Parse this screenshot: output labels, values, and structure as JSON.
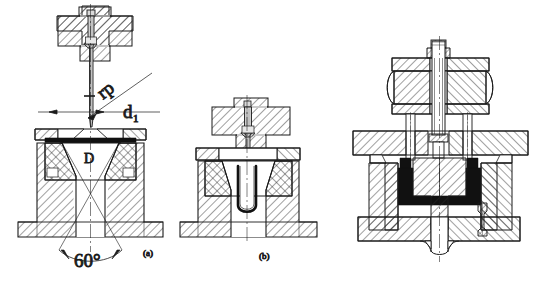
{
  "figure": {
    "background_color": "#ffffff",
    "line_color": "#1a1a1a",
    "hatch_color": "#2b2b2b",
    "fill_black": "#111111"
  },
  "panels": [
    {
      "id": "a",
      "caption": "(a)",
      "description": "Punch and conical die with 60 degree included angle, sheet blank on die face",
      "annotations": [
        {
          "name": "punch-radius",
          "text": "rp",
          "rotated": true
        },
        {
          "name": "punch-diameter",
          "text": "d",
          "subscript": "1"
        },
        {
          "name": "die-diameter",
          "text": "D"
        },
        {
          "name": "cone-angle",
          "text": "60°"
        }
      ]
    },
    {
      "id": "b",
      "caption": "(b)",
      "description": "Punch fully engaged, drawn cup formed inside die cavity",
      "annotations": []
    },
    {
      "id": "c",
      "caption": "",
      "description": "Complete die set assembly with rubber spring pad, bolster plates, guide pillars and ejector pin",
      "annotations": []
    }
  ],
  "labels": {
    "rp": "rp",
    "d": "d",
    "d_sub": "1",
    "D": "D",
    "angle": "60°",
    "cap_a": "(a)",
    "cap_b": "(b)"
  }
}
